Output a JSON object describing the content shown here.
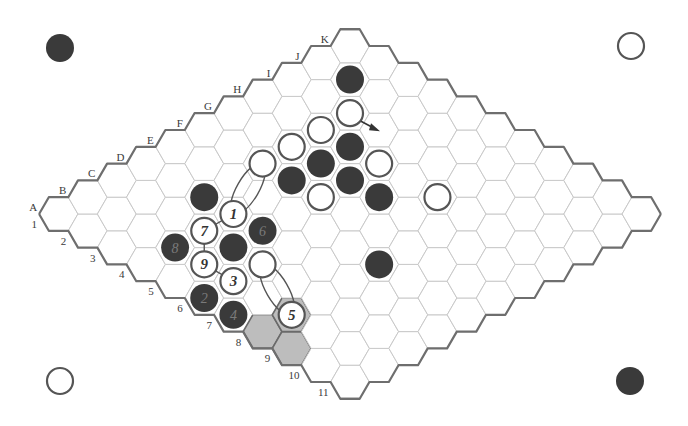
{
  "figure": {
    "type": "hex-board-diagram",
    "board_size": 11,
    "letters": [
      "A",
      "B",
      "C",
      "D",
      "E",
      "F",
      "G",
      "H",
      "I",
      "J",
      "K"
    ],
    "numbers": [
      "1",
      "2",
      "3",
      "4",
      "5",
      "6",
      "7",
      "8",
      "9",
      "10",
      "11"
    ],
    "colors": {
      "black_stone": "#3a3a3a",
      "white_stone_fill": "#ffffff",
      "white_stone_stroke": "#555555",
      "board_edge": "#6e6e6e",
      "cell_line": "#c9c9c9",
      "shaded_cell": "#bdbdbd"
    }
  },
  "corner_stones": [
    {
      "position": "top-left",
      "color": "black"
    },
    {
      "position": "top-right",
      "color": "white"
    },
    {
      "position": "bottom-left",
      "color": "white"
    },
    {
      "position": "bottom-right",
      "color": "black"
    }
  ],
  "stones": [
    {
      "cell": "J2",
      "color": "black",
      "label": ""
    },
    {
      "cell": "I3",
      "color": "white",
      "label": ""
    },
    {
      "cell": "H3",
      "color": "white",
      "label": ""
    },
    {
      "cell": "G3",
      "color": "white",
      "label": ""
    },
    {
      "cell": "F3",
      "color": "white",
      "label": ""
    },
    {
      "cell": "H4",
      "color": "black",
      "label": ""
    },
    {
      "cell": "G4",
      "color": "black",
      "label": ""
    },
    {
      "cell": "F4",
      "color": "black",
      "label": ""
    },
    {
      "cell": "G5",
      "color": "black",
      "label": ""
    },
    {
      "cell": "H5",
      "color": "white",
      "label": ""
    },
    {
      "cell": "F5",
      "color": "white",
      "label": ""
    },
    {
      "cell": "G6",
      "color": "black",
      "label": ""
    },
    {
      "cell": "H7",
      "color": "white",
      "label": ""
    },
    {
      "cell": "E8",
      "color": "black",
      "label": ""
    },
    {
      "cell": "D3",
      "color": "black",
      "label": ""
    },
    {
      "cell": "D4",
      "color": "white",
      "label": "1"
    },
    {
      "cell": "A6",
      "color": "black",
      "label": "2"
    },
    {
      "cell": "B6",
      "color": "white",
      "label": "3"
    },
    {
      "cell": "A7",
      "color": "black",
      "label": "4"
    },
    {
      "cell": "B8",
      "color": "white",
      "label": "5"
    },
    {
      "cell": "D5",
      "color": "black",
      "label": "6"
    },
    {
      "cell": "C4",
      "color": "white",
      "label": "7"
    },
    {
      "cell": "B4",
      "color": "black",
      "label": "8"
    },
    {
      "cell": "B5",
      "color": "white",
      "label": "9"
    },
    {
      "cell": "C5",
      "color": "black",
      "label": ""
    },
    {
      "cell": "C6",
      "color": "white",
      "label": ""
    }
  ],
  "shaded_cells": [
    "A8",
    "A9",
    "B8"
  ],
  "bridges": [
    {
      "from": "D4",
      "to": "F3"
    },
    {
      "from": "C6",
      "to": "B8"
    }
  ],
  "connections": [
    {
      "from": "D4",
      "to": "C4"
    },
    {
      "from": "C4",
      "to": "B5"
    },
    {
      "from": "B5",
      "to": "B6"
    }
  ],
  "arrow": {
    "from": "I3",
    "direction": "down-right"
  }
}
